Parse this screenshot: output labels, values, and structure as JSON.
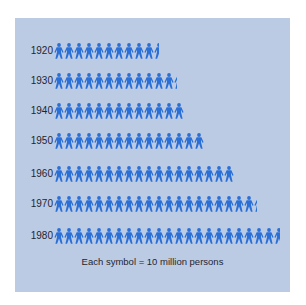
{
  "chart_data": {
    "type": "pictograph",
    "title": "",
    "unit_label": "Each symbol = 10 million persons",
    "symbol_value_millions": 10,
    "categories": [
      "1920",
      "1930",
      "1940",
      "1950",
      "1960",
      "1970",
      "1980"
    ],
    "symbols": [
      10.5,
      12.3,
      13,
      15,
      18,
      20.3,
      22.6
    ],
    "values_millions": [
      105,
      123,
      132,
      151,
      179,
      203,
      226
    ],
    "xlabel": "",
    "ylabel": "",
    "grid": false,
    "legend_position": "bottom"
  },
  "colors": {
    "panel_bg": "#bccbe4",
    "symbol": "#2a6fd6",
    "text": "#1f2530"
  },
  "icons": {
    "symbol": "person-icon"
  },
  "legend": {
    "text": "Each symbol = 10 million persons"
  }
}
